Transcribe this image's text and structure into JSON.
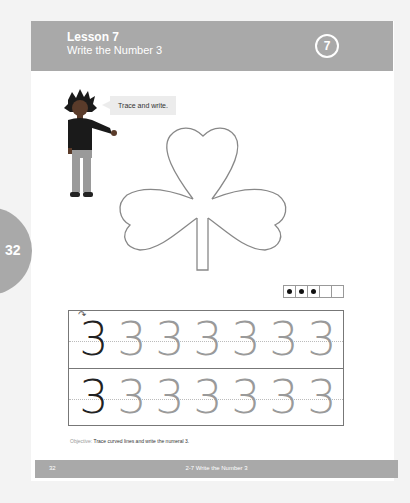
{
  "header": {
    "lesson_label": "Lesson 7",
    "lesson_title": "Write the Number 3",
    "lesson_number_badge": "7"
  },
  "side_tab": {
    "page_number": "32"
  },
  "instruction": {
    "speech_bubble": "Trace and write."
  },
  "ten_frame": {
    "filled": 3,
    "total": 5
  },
  "tracing": {
    "rows": [
      {
        "digits": [
          "3",
          "3",
          "3",
          "3",
          "3",
          "3",
          "3"
        ],
        "first_has_start_arrow": true
      },
      {
        "digits": [
          "3",
          "3",
          "3",
          "3",
          "3",
          "3",
          "3"
        ],
        "first_has_start_arrow": false
      }
    ]
  },
  "objective": {
    "label": "Objective:",
    "text": "Trace curved lines and write the numeral 3."
  },
  "footer": {
    "page_number": "32",
    "title": "2-7 Write the Number 3"
  },
  "colors": {
    "header_gray": "#a9a9a9",
    "outline": "#777777"
  }
}
